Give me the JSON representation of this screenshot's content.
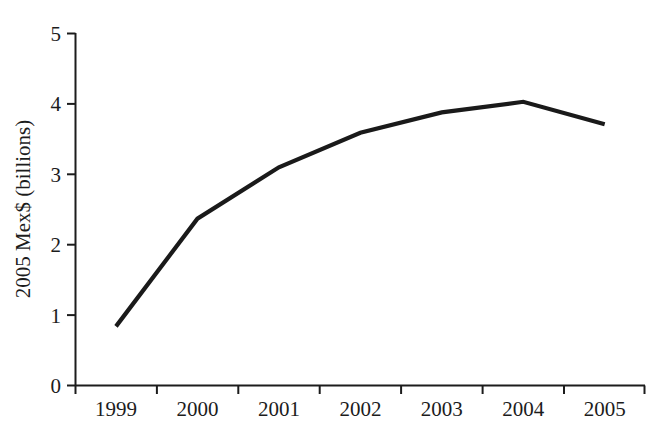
{
  "chart_data": {
    "type": "line",
    "title": "",
    "xlabel": "",
    "ylabel": "2005 Mex$ (billions)",
    "categories": [
      "1999",
      "2000",
      "2001",
      "2002",
      "2003",
      "2004",
      "2005"
    ],
    "values": [
      0.84,
      2.37,
      3.1,
      3.59,
      3.88,
      4.03,
      3.71
    ],
    "series": [
      {
        "name": "",
        "values": [
          0.84,
          2.37,
          3.1,
          3.59,
          3.88,
          4.03,
          3.71
        ]
      }
    ],
    "ylim": [
      0,
      5
    ],
    "yticks": [
      "0",
      "1",
      "2",
      "3",
      "4",
      "5"
    ],
    "ytick_values": [
      0,
      1,
      2,
      3,
      4,
      5
    ],
    "xticks": [
      "1999",
      "2000",
      "2001",
      "2002",
      "2003",
      "2004",
      "2005"
    ],
    "grid": false,
    "legend": false,
    "legend_position": "none",
    "line_color": "#1a1a1a",
    "axis_color": "#1c1c1c",
    "background_color": "#ffffff",
    "annotations": []
  }
}
